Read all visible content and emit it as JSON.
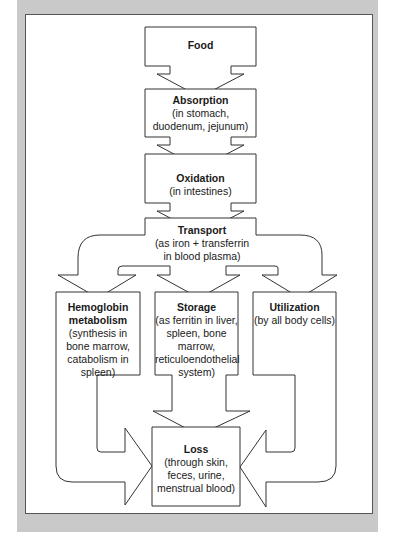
{
  "diagram": {
    "nodes": [
      {
        "id": "food",
        "title": "Food",
        "detail": ""
      },
      {
        "id": "absorption",
        "title": "Absorption",
        "detail": "(in stomach, duodenum, jejunum)"
      },
      {
        "id": "oxidation",
        "title": "Oxidation",
        "detail": "(in intestines)"
      },
      {
        "id": "transport",
        "title": "Transport",
        "detail": "(as iron + transferrin in blood plasma)"
      },
      {
        "id": "hemoglobin",
        "title": "Hemoglobin metabolism",
        "detail": "(synthesis in bone marrow, catabolism in spleen)"
      },
      {
        "id": "storage",
        "title": "Storage",
        "detail": "(as ferritin in liver, spleen, bone marrow, reticuloendothelial system)"
      },
      {
        "id": "utilization",
        "title": "Utilization",
        "detail": "(by all body cells)"
      },
      {
        "id": "loss",
        "title": "Loss",
        "detail": "(through skin, feces, urine, menstrual blood)"
      }
    ],
    "edges": [
      {
        "from": "food",
        "to": "absorption"
      },
      {
        "from": "absorption",
        "to": "oxidation"
      },
      {
        "from": "oxidation",
        "to": "transport"
      },
      {
        "from": "transport",
        "to": "hemoglobin"
      },
      {
        "from": "transport",
        "to": "storage"
      },
      {
        "from": "transport",
        "to": "utilization"
      },
      {
        "from": "hemoglobin",
        "to": "loss"
      },
      {
        "from": "storage",
        "to": "loss"
      },
      {
        "from": "utilization",
        "to": "loss"
      }
    ],
    "colors": {
      "frame": "#c9c9c9",
      "stroke": "#333333",
      "fill": "#ffffff"
    }
  }
}
